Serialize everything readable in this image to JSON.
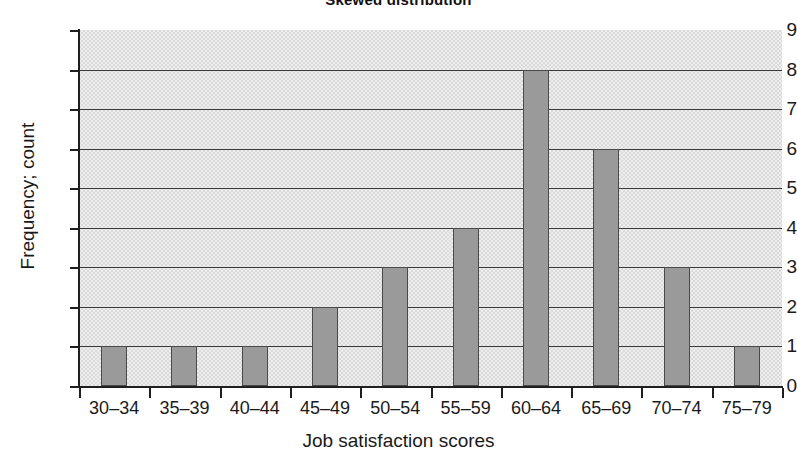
{
  "chart_data": {
    "type": "bar",
    "title": "Skewed distribution",
    "xlabel": "Job satisfaction scores",
    "ylabel": "Frequency; count",
    "categories": [
      "30–34",
      "35–39",
      "40–44",
      "45–49",
      "50–54",
      "55–59",
      "60–64",
      "65–69",
      "70–74",
      "75–79"
    ],
    "values": [
      1,
      1,
      1,
      2,
      3,
      4,
      8,
      6,
      3,
      1
    ],
    "ylim": [
      0,
      9
    ],
    "ytick_labels": [
      "9",
      "8",
      "7",
      "6",
      "5",
      "4",
      "3",
      "2",
      "1",
      "0"
    ],
    "ytick_values": [
      9,
      8,
      7,
      6,
      5,
      4,
      3,
      2,
      1,
      0
    ],
    "grid": "horizontal",
    "legend": "none",
    "bar_color": "#9a9a9a",
    "bar_border_color": "#4a4a4a",
    "plot_background_color": "#dadada",
    "gridline_color": "#3a3a3a",
    "axis_color": "#1f1f1f"
  }
}
